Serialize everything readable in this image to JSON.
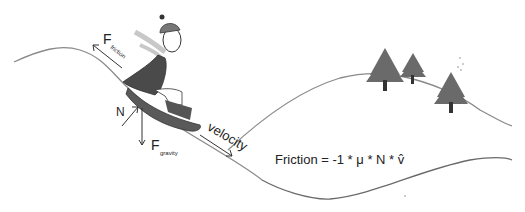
{
  "diagram": {
    "labels": {
      "friction_main": "F",
      "friction_sub": "friction",
      "normal": "N",
      "gravity_main": "F",
      "gravity_sub": "gravity",
      "velocity": "velocity"
    },
    "formula": "Friction = -1 * μ * N * v̂",
    "elements": [
      "hill-curve-left",
      "hill-curve-right",
      "hill-curve-bottom",
      "snowboarder",
      "pine-tree-1",
      "pine-tree-2",
      "pine-tree-3",
      "friction-arrow",
      "normal-arrow",
      "gravity-arrow",
      "velocity-arrow"
    ],
    "colors": {
      "line": "#8a8a8a",
      "dark": "#4a4a4a",
      "scarf": "#bdbdbd",
      "tree": "#6a6a6a",
      "trunk": "#333333"
    }
  }
}
